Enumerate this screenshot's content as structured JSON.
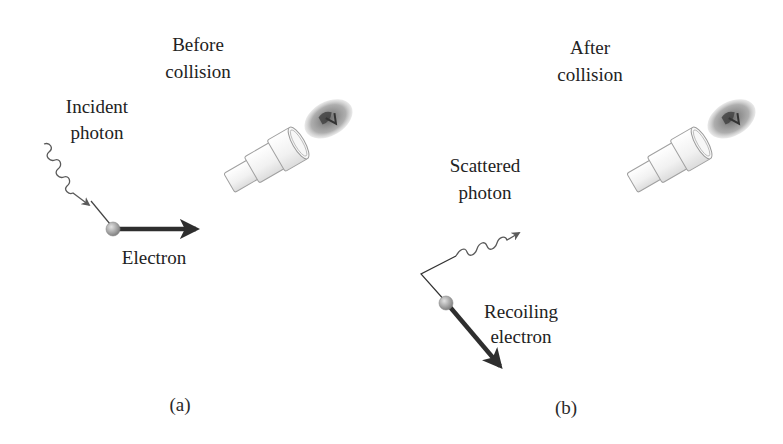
{
  "figure": {
    "panels": [
      {
        "id": "a",
        "caption": "(a)",
        "title_line1": "Before",
        "title_line2": "collision",
        "photon_label_line1": "Incident",
        "photon_label_line2": "photon",
        "electron_label_line1": "Electron",
        "electron_label_line2": ""
      },
      {
        "id": "b",
        "caption": "(b)",
        "title_line1": "After",
        "title_line2": "collision",
        "photon_label_line1": "Scattered",
        "photon_label_line2": "photon",
        "electron_label_line1": "Recoiling",
        "electron_label_line2": "electron"
      }
    ],
    "icons": {
      "observer": "eye-at-eyepiece-icon",
      "electron": "electron-sphere-icon",
      "photon": "wavy-arrow-icon",
      "momentum": "arrow-icon"
    },
    "colors": {
      "text": "#222222",
      "arrow": "#333333",
      "photon_line": "#555555",
      "electron_fill": "#a8a8a8",
      "eyepiece_stroke": "#9a9a9a"
    }
  }
}
